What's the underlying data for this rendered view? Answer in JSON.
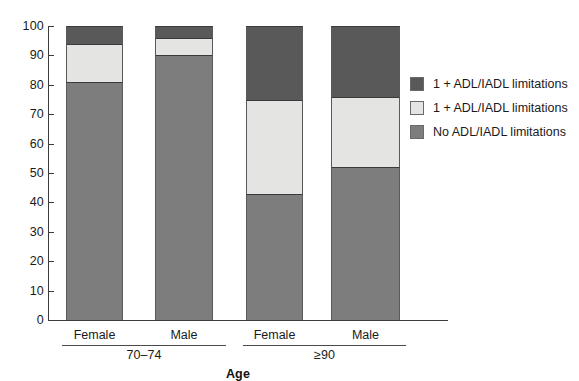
{
  "chart_data": {
    "type": "bar",
    "subtype": "stacked-percentage",
    "title": "",
    "xlabel": "Age",
    "ylabel": "",
    "ylim": [
      0,
      100
    ],
    "ytick_values": [
      0,
      10,
      20,
      30,
      40,
      50,
      60,
      70,
      80,
      90,
      100
    ],
    "ytick_labels": [
      "0",
      "10",
      "20",
      "30",
      "40",
      "50",
      "60",
      "70",
      "80",
      "90",
      "100"
    ],
    "grid": false,
    "legend_position": "right",
    "categories": [
      "Female",
      "Male",
      "Female",
      "Male"
    ],
    "groups": [
      {
        "label": "70–74",
        "categories": [
          "Female",
          "Male"
        ]
      },
      {
        "label": "≥90",
        "categories": [
          "Female",
          "Male"
        ]
      }
    ],
    "series": [
      {
        "name": "No ADL/IADL limitations",
        "color": "#7d7d7d",
        "values": [
          81,
          90,
          43,
          52
        ]
      },
      {
        "name": "1 + ADL/IADL limitations",
        "color": "#e4e4e2",
        "values": [
          13,
          6,
          32,
          24
        ]
      },
      {
        "name": "1 + ADL/IADL limitations",
        "color": "#595959",
        "values": [
          6,
          4,
          25,
          24
        ]
      }
    ],
    "legend_entries": [
      {
        "label": "1 + ADL/IADL limitations",
        "color": "#595959"
      },
      {
        "label": "1 + ADL/IADL limitations",
        "color": "#e4e4e2"
      },
      {
        "label": "No ADL/IADL limitations",
        "color": "#7d7d7d"
      }
    ],
    "colors": {
      "dark_gray": "#595959",
      "light_gray": "#e4e4e2",
      "medium_gray": "#7d7d7d",
      "axis": "#3c3c3c",
      "background": "#ffffff"
    }
  }
}
